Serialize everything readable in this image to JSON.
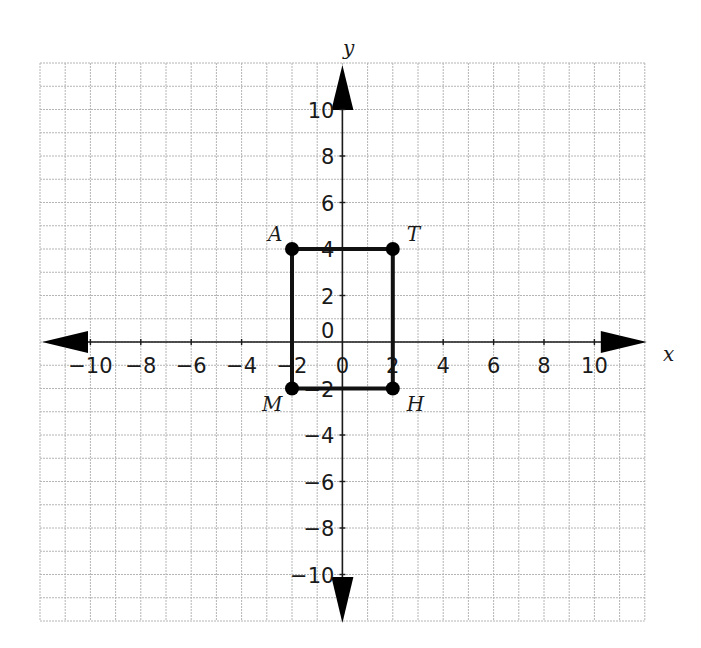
{
  "diagram": {
    "type": "coordinate-plane",
    "axes": {
      "x_label": "x",
      "y_label": "y"
    },
    "x_range": [
      -12,
      12
    ],
    "y_range": [
      -12,
      12
    ],
    "grid_step": 1,
    "tick_step": 2,
    "x_ticks": [
      "−10",
      "−8",
      "−6",
      "−4",
      "−2",
      "0",
      "2",
      "4",
      "6",
      "8",
      "10"
    ],
    "x_tick_values": [
      -10,
      -8,
      -6,
      -4,
      -2,
      0,
      2,
      4,
      6,
      8,
      10
    ],
    "y_ticks": [
      "10",
      "8",
      "6",
      "4",
      "2",
      "0",
      "−2",
      "−4",
      "−6",
      "−8",
      "−10"
    ],
    "y_tick_values": [
      10,
      8,
      6,
      4,
      2,
      0,
      -2,
      -4,
      -6,
      -8,
      -10
    ],
    "points": [
      {
        "name": "A",
        "x": -2,
        "y": 4
      },
      {
        "name": "T",
        "x": 2,
        "y": 4
      },
      {
        "name": "H",
        "x": 2,
        "y": -2
      },
      {
        "name": "M",
        "x": -2,
        "y": -2
      }
    ],
    "polygon": [
      "A",
      "T",
      "H",
      "M"
    ],
    "colors": {
      "grid": "#b4b4b4",
      "axis": "#1a1a1a",
      "shape": "#111111",
      "background": "#ffffff"
    }
  }
}
